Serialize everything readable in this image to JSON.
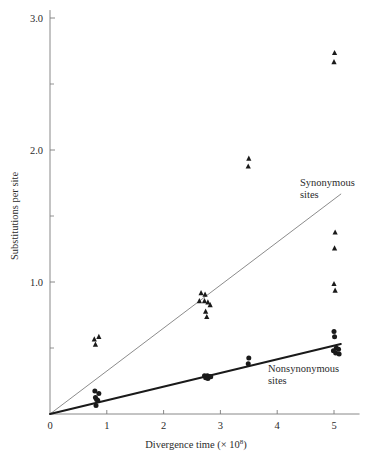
{
  "chart_data": {
    "type": "scatter",
    "title": "",
    "xlabel": "Divergence time (× 10⁸)",
    "ylabel": "Substitutions per site",
    "xlabel_main": "Divergence time (× 10",
    "xlabel_exponent": "8",
    "xlabel_close": ")",
    "xlim": [
      0,
      5.45
    ],
    "ylim": [
      0,
      3.08
    ],
    "grid": false,
    "legend_position": "inline-annotation",
    "xticks": [
      0,
      1,
      2,
      3,
      4,
      5
    ],
    "xtick_labels": [
      "0",
      "1",
      "2",
      "3",
      "4",
      "5"
    ],
    "yticks": [
      1.0,
      2.0,
      3.0
    ],
    "ytick_labels": [
      "1.0",
      "2.0",
      "3.0"
    ],
    "yminor_ticks": [
      0.5,
      1.5,
      2.5
    ],
    "series": [
      {
        "name": "Synonymous sites",
        "label": "Synonymous",
        "label_line2": "sites",
        "marker": "triangle",
        "color": "#1a1a1a",
        "line_color": "#8c8c8c",
        "line_width": 1.0,
        "fit_slope": 0.3255,
        "fit_from": [
          0,
          0
        ],
        "fit_to": [
          5.12,
          1.666
        ],
        "points": [
          [
            0.78,
            0.565
          ],
          [
            0.86,
            0.585
          ],
          [
            0.8,
            0.525
          ],
          [
            2.66,
            0.915
          ],
          [
            2.73,
            0.905
          ],
          [
            2.63,
            0.855
          ],
          [
            2.72,
            0.855
          ],
          [
            2.78,
            0.845
          ],
          [
            2.82,
            0.825
          ],
          [
            2.74,
            0.775
          ],
          [
            2.76,
            0.735
          ],
          [
            3.5,
            1.935
          ],
          [
            3.49,
            1.875
          ],
          [
            5.01,
            2.735
          ],
          [
            5.0,
            2.665
          ],
          [
            5.02,
            1.375
          ],
          [
            5.01,
            1.255
          ],
          [
            5.0,
            0.985
          ],
          [
            5.02,
            0.935
          ]
        ]
      },
      {
        "name": "Nonsynonymous sites",
        "label": "Nonsynonymous",
        "label_line2": "sites",
        "marker": "circle",
        "color": "#1a1a1a",
        "line_color": "#1a1a1a",
        "line_width": 2.0,
        "fit_slope": 0.1035,
        "fit_from": [
          0,
          0
        ],
        "fit_to": [
          5.12,
          0.53
        ],
        "points": [
          [
            0.79,
            0.175
          ],
          [
            0.86,
            0.155
          ],
          [
            0.8,
            0.125
          ],
          [
            0.82,
            0.11
          ],
          [
            0.84,
            0.105
          ],
          [
            0.81,
            0.065
          ],
          [
            2.72,
            0.29
          ],
          [
            2.77,
            0.29
          ],
          [
            2.8,
            0.285
          ],
          [
            2.74,
            0.275
          ],
          [
            2.78,
            0.268
          ],
          [
            2.83,
            0.282
          ],
          [
            3.5,
            0.425
          ],
          [
            3.49,
            0.38
          ],
          [
            5.0,
            0.625
          ],
          [
            5.01,
            0.585
          ],
          [
            5.04,
            0.5
          ],
          [
            4.99,
            0.48
          ],
          [
            5.03,
            0.462
          ],
          [
            5.08,
            0.49
          ],
          [
            5.09,
            0.455
          ]
        ]
      }
    ]
  },
  "axes": {
    "y_title": "Substitutions per site",
    "x_title_prefix": "Divergence time (× 10",
    "x_title_sup": "8",
    "x_title_suffix": ")"
  },
  "colors": {
    "synonymous_line": "#8c8c8c",
    "nonsynonymous_line": "#1a1a1a",
    "marker": "#1a1a1a",
    "axis": "#7a7a7a",
    "text": "#2b2b2b",
    "background": "#ffffff"
  }
}
